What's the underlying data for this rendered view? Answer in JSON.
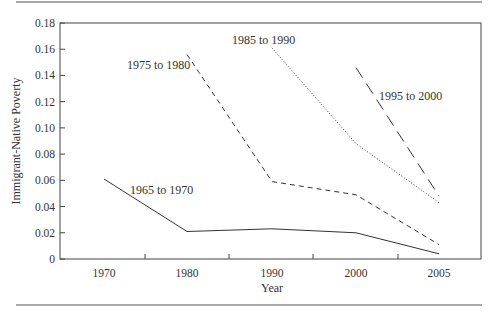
{
  "chart_data": {
    "type": "line",
    "title": "",
    "xlabel": "Year",
    "ylabel": "Immigrant-Native Poverty",
    "categories": [
      "1970",
      "1980",
      "1990",
      "2000",
      "2005"
    ],
    "y_ticks": [
      "0",
      "0.02",
      "0.04",
      "0.06",
      "0.08",
      "0.10",
      "0.12",
      "0.14",
      "0.16",
      "0.18"
    ],
    "ylim": [
      0,
      0.18
    ],
    "grid": false,
    "legend": "inline labels",
    "series": [
      {
        "name": "1965 to 1970",
        "style": "solid",
        "values": [
          0.061,
          0.021,
          0.023,
          0.02,
          0.004
        ]
      },
      {
        "name": "1975 to 1980",
        "style": "dashed",
        "values": [
          null,
          0.156,
          0.059,
          0.049,
          0.011
        ]
      },
      {
        "name": "1985 to 1990",
        "style": "dotted",
        "values": [
          null,
          null,
          0.161,
          0.088,
          0.043
        ]
      },
      {
        "name": "1995 to 2000",
        "style": "long-dashed",
        "values": [
          null,
          null,
          null,
          0.146,
          0.048
        ]
      }
    ]
  }
}
